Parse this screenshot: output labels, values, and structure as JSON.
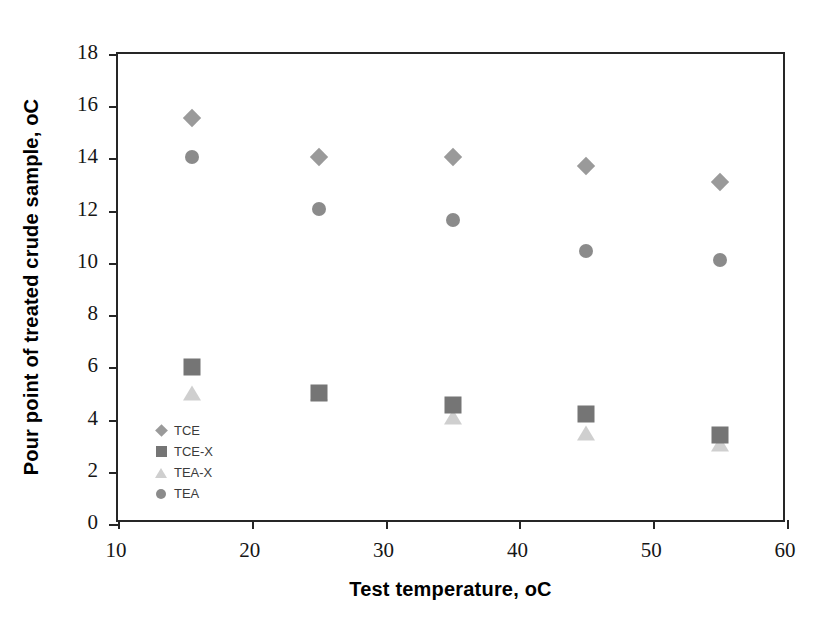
{
  "chart_data": {
    "type": "scatter",
    "title": "",
    "xlabel": "Test temperature, oC",
    "ylabel": "Pour point of treated crude sample, oC",
    "xlim": [
      10,
      60
    ],
    "ylim": [
      0,
      18
    ],
    "xticks": [
      10,
      20,
      30,
      40,
      50,
      60
    ],
    "yticks": [
      0,
      2,
      4,
      6,
      8,
      10,
      12,
      14,
      16,
      18
    ],
    "grid": false,
    "legend_position": "inside-lower-left",
    "x": [
      15.5,
      25,
      35,
      45,
      55
    ],
    "series": [
      {
        "name": "TCE",
        "marker": "diamond",
        "color": "#9a9a9a",
        "values": [
          15.55,
          14.05,
          14.05,
          13.7,
          13.1
        ]
      },
      {
        "name": "TCE-X",
        "marker": "square",
        "color": "#757575",
        "values": [
          6.0,
          5.0,
          4.55,
          4.2,
          3.4
        ]
      },
      {
        "name": "TEA-X",
        "marker": "triangle",
        "color": "#cfcfcf",
        "values": [
          5.0,
          5.0,
          4.1,
          3.5,
          3.05
        ]
      },
      {
        "name": "TEA",
        "marker": "circle",
        "color": "#8b8b8b",
        "values": [
          14.05,
          12.05,
          11.65,
          10.45,
          10.1
        ]
      }
    ]
  }
}
